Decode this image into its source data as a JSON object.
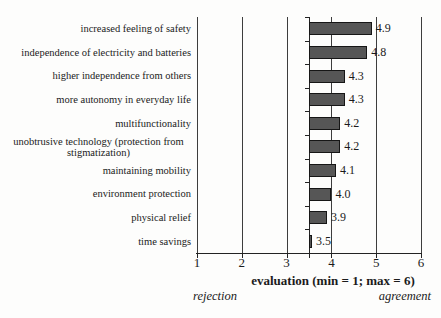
{
  "chart_data": {
    "type": "bar",
    "orientation": "horizontal",
    "categories": [
      "increased feeling of safety",
      "independence of electricity and batteries",
      "higher independence from others",
      "more autonomy in everyday life",
      "multifunctionality",
      "unobtrusive technology (protection from stigmatization)",
      "maintaining mobility",
      "environment protection",
      "physical relief",
      "time savings"
    ],
    "values": [
      4.9,
      4.8,
      4.3,
      4.3,
      4.2,
      4.2,
      4.1,
      4.0,
      3.9,
      3.5
    ],
    "value_labels": [
      "4.9",
      "4.8",
      "4.3",
      "4.3",
      "4.2",
      "4.2",
      "4.1",
      "4.0",
      "3.9",
      "3.5"
    ],
    "xlabel": "evaluation (min = 1; max = 6)",
    "xlim": [
      1,
      6
    ],
    "x_ticks": [
      1,
      2,
      3,
      4,
      5,
      6
    ],
    "x_tick_labels": [
      "1",
      "2",
      "3",
      "4",
      "5",
      "6"
    ],
    "bar_baseline": 3.5,
    "grid": true,
    "annotations": {
      "left": "rejection",
      "right": "agreement"
    },
    "colors": {
      "bar_fill": "#565656",
      "bar_border": "#161616",
      "line": "#3d3d3d",
      "text": "#1b1b1b",
      "background": "#fdfdfc"
    }
  }
}
